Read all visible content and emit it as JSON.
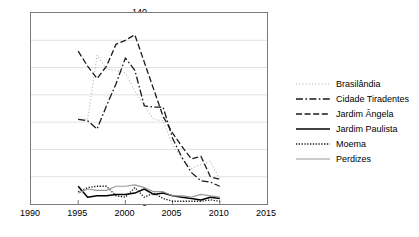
{
  "chart_data": {
    "type": "line",
    "title": "",
    "xlabel": "",
    "ylabel": "",
    "xlim": [
      1990,
      2015
    ],
    "ylim": [
      0,
      140
    ],
    "xticks": [
      1990,
      1995,
      2000,
      2005,
      2010,
      2015
    ],
    "yticks": [
      0,
      20,
      40,
      60,
      80,
      100,
      120,
      140
    ],
    "grid": "horizontal",
    "legend_position": "right",
    "x": [
      1995,
      1996,
      1997,
      1998,
      1999,
      2000,
      2001,
      2002,
      2003,
      2004,
      2005,
      2006,
      2007,
      2008,
      2009,
      2010
    ],
    "series": [
      {
        "name": "Brasilândia",
        "style": "dotted-fine",
        "color": "#b0b0b0",
        "values": [
          62,
          62,
          109,
          99,
          98,
          96,
          83,
          72,
          62,
          61,
          43,
          33,
          26,
          29,
          31,
          18
        ]
      },
      {
        "name": "Cidade Tiradentes",
        "style": "dash-dot",
        "color": "#1a1a1a",
        "values": [
          62,
          61,
          55,
          72,
          88,
          107,
          98,
          72,
          71,
          71,
          48,
          34,
          23,
          17,
          16,
          13
        ]
      },
      {
        "name": "Jardim Ângela",
        "style": "dashed",
        "color": "#1a1a1a",
        "values": [
          112,
          101,
          92,
          101,
          117,
          120,
          124,
          104,
          84,
          64,
          52,
          42,
          33,
          35,
          20,
          18
        ]
      },
      {
        "name": "Jardim Paulista",
        "style": "solid",
        "color": "#000000",
        "values": [
          13,
          5,
          6,
          6,
          7,
          7,
          8,
          11,
          7,
          8,
          6,
          5,
          4,
          3,
          5,
          4
        ]
      },
      {
        "name": "Moema",
        "style": "dotted",
        "color": "#1a1a1a",
        "values": [
          9,
          12,
          13,
          13,
          6,
          5,
          12,
          5,
          8,
          4,
          2,
          2,
          2,
          2,
          3,
          2
        ]
      },
      {
        "name": "Perdizes",
        "style": "solid-light",
        "color": "#9a9a9a",
        "values": [
          8,
          11,
          10,
          10,
          13,
          13,
          14,
          12,
          9,
          9,
          6,
          6,
          5,
          7,
          6,
          5
        ]
      }
    ]
  }
}
